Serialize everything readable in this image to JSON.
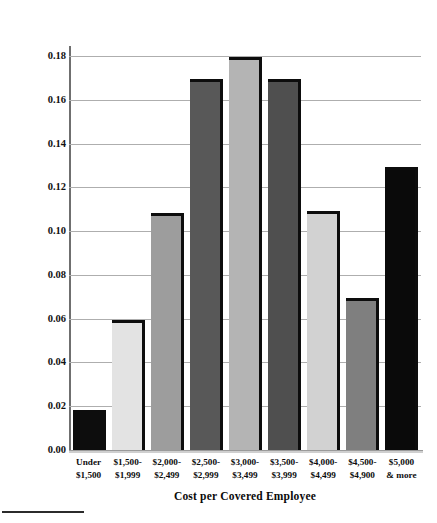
{
  "chart_data": {
    "type": "bar",
    "title": "",
    "xlabel": "Cost per Covered Employee",
    "ylabel": "Percent of Firms",
    "categories": [
      "Under $1,500",
      "$1,500-$1,999",
      "$2,000-$2,499",
      "$2,500-$2,999",
      "$3,000-$3,499",
      "$3,500-$3,999",
      "$4,000-$4,499",
      "$4,500-$4,900",
      "$5,000 & more"
    ],
    "category_lines": [
      [
        "Under",
        "$1,500"
      ],
      [
        "$1,500-",
        "$1,999"
      ],
      [
        "$2,000-",
        "$2,499"
      ],
      [
        "$2,500-",
        "$2,999"
      ],
      [
        "$3,000-",
        "$3,499"
      ],
      [
        "$3,500-",
        "$3,999"
      ],
      [
        "$4,000-",
        "$4,499"
      ],
      [
        "$4,500-",
        "$4,900"
      ],
      [
        "$5,000",
        "& more"
      ]
    ],
    "values": [
      0.017,
      0.058,
      0.107,
      0.168,
      0.178,
      0.168,
      0.108,
      0.068,
      0.128
    ],
    "bar_colors": [
      "#0d0d0d",
      "#e3e3e3",
      "#9d9d9d",
      "#585858",
      "#b4b4b4",
      "#4f4f4f",
      "#d2d2d2",
      "#7f7f7f",
      "#0a0a0a"
    ],
    "bar_edge_color": "#0d0d0d",
    "ylim": [
      0.0,
      0.18
    ],
    "ytick_values": [
      0.18,
      0.16,
      0.14,
      0.12,
      0.1,
      0.08,
      0.06,
      0.04,
      0.02,
      0.0
    ],
    "ytick_labels": [
      "0.18",
      "0.16",
      "0.14",
      "0.12",
      "0.10",
      "0.08",
      "0.06",
      "0.04",
      "0.02",
      "0.00"
    ],
    "grid": "horizontal",
    "gridline_color": "#aeaeae",
    "legend": "none"
  }
}
